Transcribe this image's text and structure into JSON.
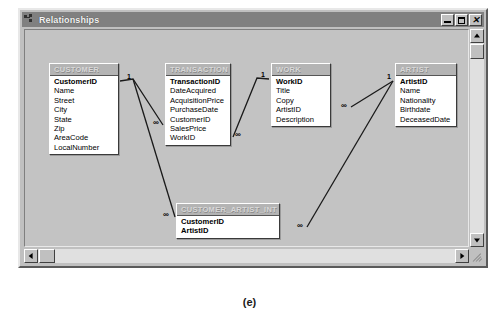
{
  "window": {
    "title": "Relationships",
    "icon": "relationships-icon",
    "buttons": [
      {
        "name": "minimize-button",
        "label": "_",
        "glyph": "minimize"
      },
      {
        "name": "maximize-button",
        "label": "□",
        "glyph": "maximize"
      },
      {
        "name": "close-button",
        "label": "×",
        "glyph": "close"
      }
    ]
  },
  "caption": "(e)",
  "entities": [
    {
      "name": "CUSTOMER",
      "x": 28,
      "y": 52,
      "width": 70,
      "fields": [
        {
          "label": "CustomerID",
          "key": true
        },
        {
          "label": "Name",
          "key": false
        },
        {
          "label": "Street",
          "key": false
        },
        {
          "label": "City",
          "key": false
        },
        {
          "label": "State",
          "key": false
        },
        {
          "label": "Zip",
          "key": false
        },
        {
          "label": "AreaCode",
          "key": false
        },
        {
          "label": "LocalNumber",
          "key": false
        }
      ]
    },
    {
      "name": "TRANSACTION",
      "x": 144,
      "y": 52,
      "width": 66,
      "fields": [
        {
          "label": "TransactionID",
          "key": true
        },
        {
          "label": "DateAcquired",
          "key": false
        },
        {
          "label": "AcquisitionPrice",
          "key": false
        },
        {
          "label": "PurchaseDate",
          "key": false
        },
        {
          "label": "CustomerID",
          "key": false
        },
        {
          "label": "SalesPrice",
          "key": false
        },
        {
          "label": "WorkID",
          "key": false
        }
      ]
    },
    {
      "name": "WORK",
      "x": 250,
      "y": 52,
      "width": 60,
      "fields": [
        {
          "label": "WorkID",
          "key": true
        },
        {
          "label": "Title",
          "key": false
        },
        {
          "label": "Copy",
          "key": false
        },
        {
          "label": "ArtistID",
          "key": false
        },
        {
          "label": "Description",
          "key": false
        }
      ]
    },
    {
      "name": "ARTIST",
      "x": 374,
      "y": 52,
      "width": 62,
      "fields": [
        {
          "label": "ArtistID",
          "key": true
        },
        {
          "label": "Name",
          "key": false
        },
        {
          "label": "Nationality",
          "key": false
        },
        {
          "label": "Birthdate",
          "key": false
        },
        {
          "label": "DeceasedDate",
          "key": false
        }
      ]
    },
    {
      "name": "CUSTOMER_ARTIST_INT",
      "x": 155,
      "y": 192,
      "width": 104,
      "fields": [
        {
          "label": "CustomerID",
          "key": true
        },
        {
          "label": "ArtistID",
          "key": true
        }
      ]
    }
  ],
  "relationships": [
    {
      "id": "customer-transaction",
      "from": "CUSTOMER",
      "to": "TRANSACTION",
      "from_cardinality": "1",
      "to_cardinality": "∞",
      "points": "99,70 112,68 142,114",
      "one_label": {
        "text": "1",
        "x": 106,
        "y": 62
      },
      "many_label": {
        "text": "∞",
        "x": 132,
        "y": 108
      }
    },
    {
      "id": "transaction-work",
      "from": "WORK",
      "to": "TRANSACTION",
      "from_cardinality": "1",
      "to_cardinality": "∞",
      "points": "248,68 236,67 212,126",
      "one_label": {
        "text": "1",
        "x": 240,
        "y": 60
      },
      "many_label": {
        "text": "∞",
        "x": 214,
        "y": 120
      }
    },
    {
      "id": "work-artist",
      "from": "ARTIST",
      "to": "WORK",
      "from_cardinality": "1",
      "to_cardinality": "∞",
      "points": "372,70 330,96",
      "one_label": {
        "text": "1",
        "x": 366,
        "y": 62
      },
      "many_label": {
        "text": "∞",
        "x": 320,
        "y": 91
      }
    },
    {
      "id": "customer-intersection",
      "from": "CUSTOMER",
      "to": "CUSTOMER_ARTIST_INT",
      "from_cardinality": "1",
      "to_cardinality": "∞",
      "points": "112,68 154,206",
      "one_label": {
        "text": "1",
        "x": 106,
        "y": 62
      },
      "many_label": {
        "text": "∞",
        "x": 142,
        "y": 200
      }
    },
    {
      "id": "artist-intersection",
      "from": "ARTIST",
      "to": "CUSTOMER_ARTIST_INT",
      "from_cardinality": "1",
      "to_cardinality": "∞",
      "points": "372,70 286,216",
      "one_label": {
        "text": "1",
        "x": 366,
        "y": 62
      },
      "many_label": {
        "text": "∞",
        "x": 276,
        "y": 211
      }
    }
  ],
  "scrollbars": {
    "vertical": {
      "up": "▲",
      "down": "▼",
      "thumb_position": "top"
    },
    "horizontal": {
      "left": "◀",
      "right": "▶",
      "thumb_position": "left"
    }
  }
}
